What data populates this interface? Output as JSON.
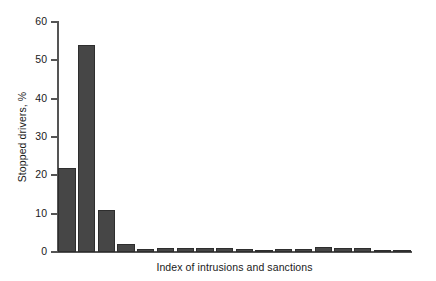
{
  "chart_data": {
    "type": "bar",
    "title": "",
    "subtitle": "",
    "xlabel": "Index of intrusions and sanctions",
    "ylabel": "Stopped drivers, %",
    "ylim": [
      0,
      60
    ],
    "yticks": [
      0,
      10,
      20,
      30,
      40,
      50,
      60
    ],
    "ytick_labels": [
      "0",
      "10",
      "20",
      "30",
      "40",
      "50",
      "60"
    ],
    "grid": false,
    "legend": null,
    "legend_position": "none",
    "bar_color": "#464646",
    "bar_edge_color": "#2e2e2e",
    "axis_color": "#555555",
    "background_color": "#ffffff",
    "n_bars": 18,
    "categories": [
      "1",
      "2",
      "3",
      "4",
      "5",
      "6",
      "7",
      "8",
      "9",
      "10",
      "11",
      "12",
      "13",
      "14",
      "15",
      "16",
      "17",
      "18"
    ],
    "values": [
      22.0,
      54.0,
      11.0,
      2.0,
      0.8,
      1.1,
      1.0,
      1.1,
      1.0,
      0.9,
      0.1,
      0.8,
      0.9,
      1.3,
      1.1,
      1.1,
      0.5,
      0.6
    ],
    "annotations": []
  }
}
